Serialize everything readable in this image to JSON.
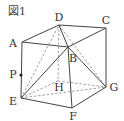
{
  "figure": {
    "title": "図1",
    "colors": {
      "line": "#444444",
      "dashed": "#888888",
      "text": "#333333"
    },
    "vertices": {
      "A": {
        "label": "A",
        "x": 22,
        "y": 42,
        "lx": 13,
        "ly": 43
      },
      "B": {
        "label": "B",
        "x": 68,
        "y": 47,
        "lx": 73,
        "ly": 58
      },
      "C": {
        "label": "C",
        "x": 106,
        "y": 28,
        "lx": 106,
        "ly": 20
      },
      "D": {
        "label": "D",
        "x": 59,
        "y": 25,
        "lx": 59,
        "ly": 17
      },
      "E": {
        "label": "E",
        "x": 21,
        "y": 98,
        "lx": 13,
        "ly": 101
      },
      "F": {
        "label": "F",
        "x": 72,
        "y": 108,
        "lx": 73,
        "ly": 116
      },
      "G": {
        "label": "G",
        "x": 106,
        "y": 87,
        "lx": 114,
        "ly": 87
      },
      "H": {
        "label": "H",
        "x": 58,
        "y": 81,
        "lx": 59,
        "ly": 87
      },
      "P": {
        "label": "P",
        "x": 21,
        "y": 75,
        "lx": 13,
        "ly": 74
      }
    },
    "solid_edges": [
      [
        "A",
        "D"
      ],
      [
        "D",
        "C"
      ],
      [
        "A",
        "B"
      ],
      [
        "B",
        "C"
      ],
      [
        "A",
        "E"
      ],
      [
        "B",
        "F"
      ],
      [
        "C",
        "G"
      ],
      [
        "E",
        "F"
      ],
      [
        "F",
        "G"
      ],
      [
        "D",
        "B"
      ],
      [
        "B",
        "G"
      ],
      [
        "E",
        "B"
      ]
    ],
    "dashed_edges": [
      [
        "D",
        "H"
      ],
      [
        "E",
        "H"
      ],
      [
        "H",
        "G"
      ],
      [
        "E",
        "D"
      ],
      [
        "E",
        "G"
      ],
      [
        "D",
        "G"
      ]
    ]
  }
}
